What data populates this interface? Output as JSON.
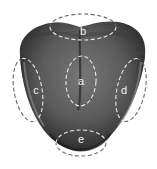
{
  "diagram": {
    "colors": {
      "background": "#ffffff",
      "tongue_dark": "#2e2e2e",
      "tongue_mid": "#5a5a5a",
      "tongue_light": "#8a8a8a",
      "dashed_on_tongue": "#e8e8e8",
      "dashed_off_tongue": "#6a6a6a",
      "label_text": "#f2f2f2"
    },
    "regions": [
      {
        "id": "a",
        "label": "a",
        "cx": 81,
        "cy": 81,
        "rx": 15,
        "ry": 25,
        "rotate": 3
      },
      {
        "id": "b",
        "label": "b",
        "cx": 83,
        "cy": 27,
        "rx": 33,
        "ry": 13,
        "rotate": 0
      },
      {
        "id": "c",
        "label": "c",
        "cx": 28,
        "cy": 90,
        "rx": 14,
        "ry": 32,
        "rotate": -10
      },
      {
        "id": "d",
        "label": "d",
        "cx": 131,
        "cy": 90,
        "rx": 14,
        "ry": 32,
        "rotate": 12
      },
      {
        "id": "e",
        "label": "e",
        "cx": 81,
        "cy": 143,
        "rx": 25,
        "ry": 13,
        "rotate": 0
      }
    ]
  }
}
